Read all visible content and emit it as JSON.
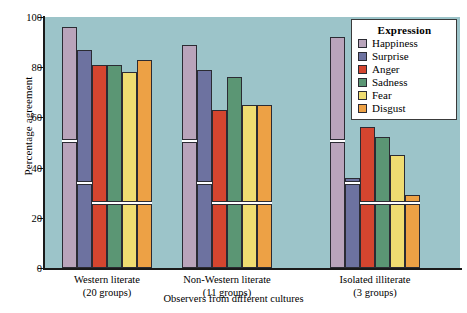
{
  "chart_data": {
    "type": "bar",
    "title": "",
    "xlabel": "Observers from different cultures",
    "ylabel": "Percentage agreement",
    "ylim": [
      0,
      100
    ],
    "yticks": [
      0,
      20,
      40,
      60,
      80,
      100
    ],
    "grid": false,
    "legend_title": "Expression",
    "legend_position": "top-right",
    "categories": [
      "Western literate\n(20 groups)",
      "Non-Western literate\n(11 groups)",
      "Isolated illiterate\n(3 groups)"
    ],
    "category_labels": [
      {
        "line1": "Western literate",
        "line2": "(20 groups)"
      },
      {
        "line1": "Non-Western literate",
        "line2": "(11 groups)"
      },
      {
        "line1": "Isolated illiterate",
        "line2": "(3 groups)"
      }
    ],
    "series": [
      {
        "name": "Happiness",
        "color": "#b9a4bb",
        "values": [
          96,
          89,
          92
        ],
        "markers": [
          50,
          50,
          50
        ]
      },
      {
        "name": "Surprise",
        "color": "#6d72a0",
        "values": [
          87,
          79,
          36
        ],
        "markers": [
          33,
          33,
          33
        ]
      },
      {
        "name": "Anger",
        "color": "#d4452f",
        "values": [
          81,
          63,
          56
        ],
        "markers": [
          25,
          25,
          25
        ]
      },
      {
        "name": "Sadness",
        "color": "#5b9674",
        "values": [
          81,
          76,
          52
        ],
        "markers": [
          25,
          25,
          25
        ]
      },
      {
        "name": "Fear",
        "color": "#efdc71",
        "values": [
          78,
          65,
          45
        ],
        "markers": [
          25,
          25,
          25
        ]
      },
      {
        "name": "Disgust",
        "color": "#eda145",
        "values": [
          83,
          65,
          29
        ],
        "markers": [
          25,
          25,
          25
        ]
      }
    ],
    "marker_note": "white horizontal band inside each bar marks chance-level agreement",
    "plot_background": "#9cc4c9"
  }
}
